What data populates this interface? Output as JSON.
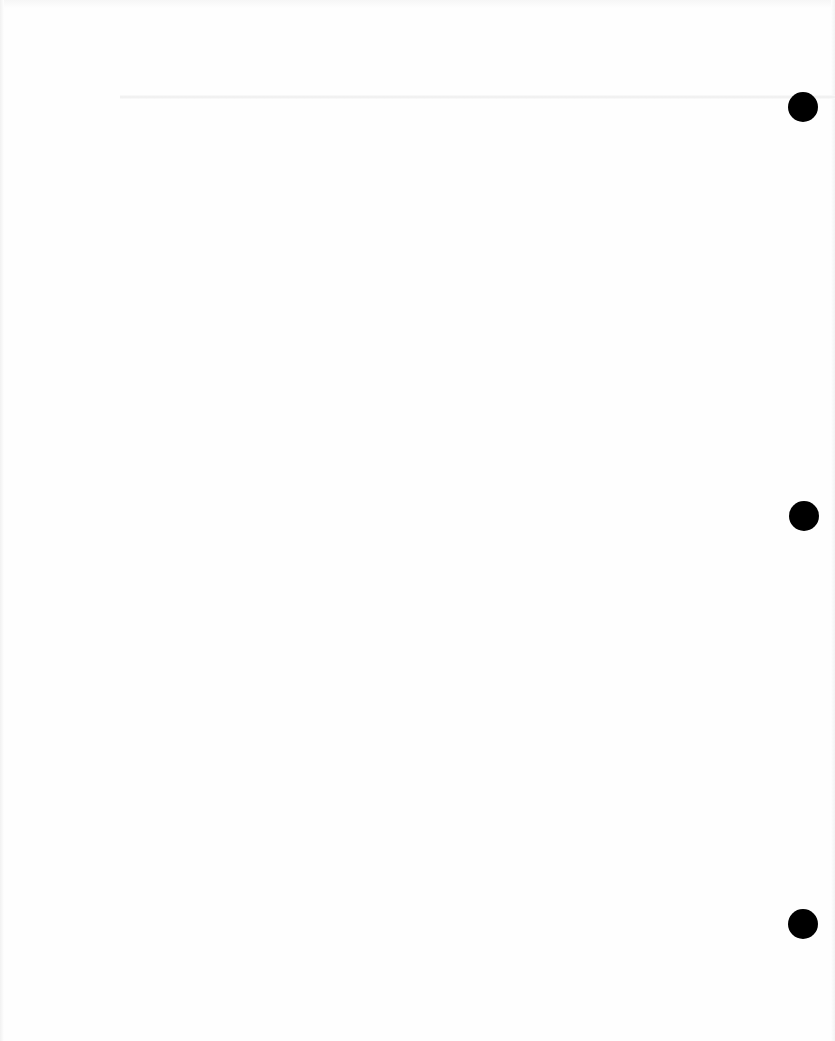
{
  "page": {
    "type": "blank three-hole-punched sheet",
    "background_color": "#fefefe",
    "text": ""
  },
  "punch_holes": [
    {
      "position": "top",
      "center_x": 803,
      "center_y": 107,
      "diameter": 30,
      "color": "#000000"
    },
    {
      "position": "middle",
      "center_x": 804,
      "center_y": 516,
      "diameter": 30,
      "color": "#000000"
    },
    {
      "position": "bottom",
      "center_x": 803,
      "center_y": 924,
      "diameter": 30,
      "color": "#000000"
    }
  ],
  "crease": {
    "y": 97,
    "color": "#ececec"
  }
}
